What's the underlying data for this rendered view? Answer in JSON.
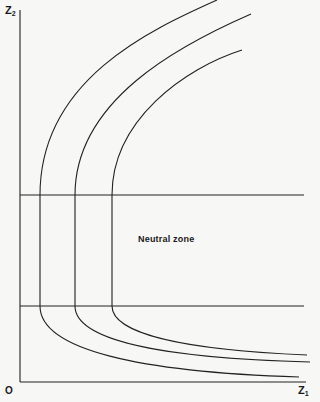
{
  "diagram": {
    "axes": {
      "y_label_main": "Z",
      "y_label_sub": "2",
      "x_label_main": "Z",
      "x_label_sub": "1",
      "origin_label": "O"
    },
    "zone_label": "Neutral zone",
    "colors": {
      "line": "#222222",
      "background": "#f7f7f5"
    },
    "curves": [
      {
        "name": "outer",
        "vertical_x": 40
      },
      {
        "name": "middle",
        "vertical_x": 75
      },
      {
        "name": "inner",
        "vertical_x": 112
      }
    ]
  }
}
